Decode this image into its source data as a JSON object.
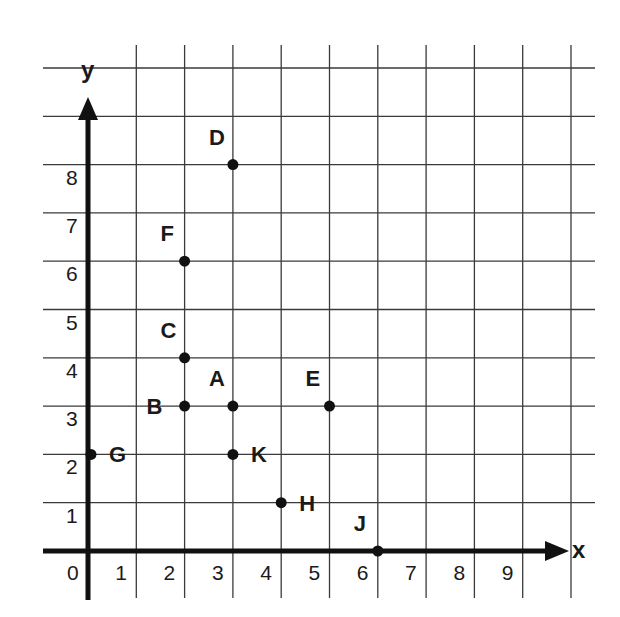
{
  "chart_data": {
    "type": "scatter",
    "title": "",
    "xlabel": "x",
    "ylabel": "y",
    "xlim": [
      0,
      10
    ],
    "ylim": [
      0,
      10
    ],
    "grid": true,
    "x_ticks": [
      "0",
      "1",
      "2",
      "3",
      "4",
      "5",
      "6",
      "7",
      "8",
      "9"
    ],
    "y_ticks": [
      "1",
      "2",
      "3",
      "4",
      "5",
      "6",
      "7",
      "8"
    ],
    "points": [
      {
        "label": "A",
        "x": 3,
        "y": 3,
        "label_pos": "above-left"
      },
      {
        "label": "B",
        "x": 2,
        "y": 3,
        "label_pos": "left"
      },
      {
        "label": "C",
        "x": 2,
        "y": 4,
        "label_pos": "above-left"
      },
      {
        "label": "D",
        "x": 3,
        "y": 8,
        "label_pos": "above-left"
      },
      {
        "label": "E",
        "x": 5,
        "y": 3,
        "label_pos": "above-left"
      },
      {
        "label": "F",
        "x": 2,
        "y": 6,
        "label_pos": "above-left"
      },
      {
        "label": "G",
        "x": 0,
        "y": 2,
        "label_pos": "right"
      },
      {
        "label": "H",
        "x": 4,
        "y": 1,
        "label_pos": "right"
      },
      {
        "label": "J",
        "x": 6,
        "y": 0,
        "label_pos": "above-left"
      },
      {
        "label": "K",
        "x": 3,
        "y": 2,
        "label_pos": "right"
      }
    ]
  },
  "colors": {
    "background": "#ffffff",
    "grid": "#3a3a3a",
    "axis": "#111111",
    "points": "#111111"
  }
}
